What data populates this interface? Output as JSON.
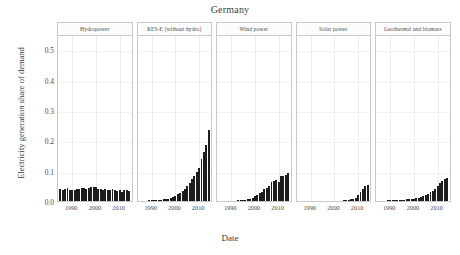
{
  "chart_data": {
    "type": "bar",
    "title": "Germany",
    "xlabel": "Date",
    "ylabel": "Electricity generation share of demand",
    "ylim": [
      0.0,
      0.55
    ],
    "xlim": [
      1984,
      2015
    ],
    "grid": true,
    "legend": "none",
    "ytick_labels": [
      "0.0",
      "0.1",
      "0.2",
      "0.3",
      "0.4",
      "0.5"
    ],
    "ytick_values": [
      0.0,
      0.1,
      0.2,
      0.3,
      0.4,
      0.5
    ],
    "xtick_labels": [
      "1990",
      "2000",
      "2010"
    ],
    "xtick_values": [
      1990,
      2000,
      2010
    ],
    "x": [
      1985,
      1986,
      1987,
      1988,
      1989,
      1990,
      1991,
      1992,
      1993,
      1994,
      1995,
      1996,
      1997,
      1998,
      1999,
      2000,
      2001,
      2002,
      2003,
      2004,
      2005,
      2006,
      2007,
      2008,
      2009,
      2010,
      2011,
      2012,
      2013,
      2014
    ],
    "panels": [
      {
        "label": "Hydropower",
        "max_value": 0.049,
        "values": [
          0.038,
          0.036,
          0.039,
          0.042,
          0.036,
          0.037,
          0.035,
          0.04,
          0.041,
          0.043,
          0.044,
          0.04,
          0.042,
          0.045,
          0.046,
          0.046,
          0.041,
          0.04,
          0.035,
          0.038,
          0.037,
          0.037,
          0.038,
          0.037,
          0.033,
          0.035,
          0.03,
          0.036,
          0.036,
          0.033
        ]
      },
      {
        "label": "RES-E (without hydro)",
        "max_value": 0.235,
        "values": [
          0.001,
          0.001,
          0.001,
          0.001,
          0.002,
          0.002,
          0.002,
          0.003,
          0.003,
          0.004,
          0.005,
          0.006,
          0.008,
          0.011,
          0.014,
          0.018,
          0.023,
          0.028,
          0.033,
          0.041,
          0.05,
          0.06,
          0.073,
          0.083,
          0.095,
          0.108,
          0.138,
          0.16,
          0.186,
          0.235
        ]
      },
      {
        "label": "Wind power",
        "max_value": 0.092,
        "values": [
          0.0,
          0.0,
          0.0,
          0.0,
          0.0,
          0.001,
          0.001,
          0.001,
          0.002,
          0.002,
          0.003,
          0.004,
          0.005,
          0.008,
          0.011,
          0.015,
          0.021,
          0.026,
          0.031,
          0.039,
          0.044,
          0.051,
          0.063,
          0.066,
          0.07,
          0.062,
          0.081,
          0.081,
          0.086,
          0.092
        ]
      },
      {
        "label": "Solar power",
        "max_value": 0.052,
        "values": [
          0.0,
          0.0,
          0.0,
          0.0,
          0.0,
          0.0,
          0.0,
          0.0,
          0.0,
          0.0,
          0.0,
          0.0,
          0.0,
          0.0,
          0.0,
          0.0,
          0.001,
          0.001,
          0.001,
          0.002,
          0.003,
          0.004,
          0.006,
          0.008,
          0.011,
          0.019,
          0.031,
          0.041,
          0.049,
          0.052
        ]
      },
      {
        "label": "Geothermal and biomass",
        "max_value": 0.077,
        "values": [
          0.001,
          0.001,
          0.001,
          0.001,
          0.002,
          0.002,
          0.002,
          0.002,
          0.003,
          0.003,
          0.004,
          0.004,
          0.005,
          0.006,
          0.007,
          0.008,
          0.009,
          0.011,
          0.013,
          0.016,
          0.02,
          0.024,
          0.029,
          0.034,
          0.041,
          0.05,
          0.058,
          0.065,
          0.071,
          0.077
        ]
      }
    ]
  }
}
